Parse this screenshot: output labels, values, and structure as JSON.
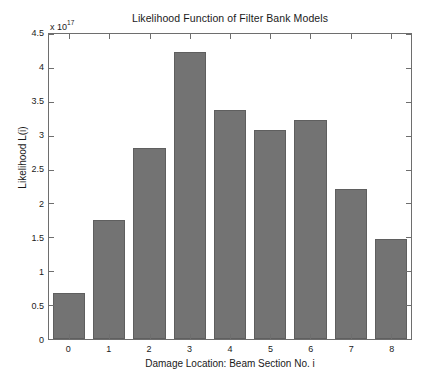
{
  "chart_data": {
    "type": "bar",
    "title": "Likelihood Function of Filter Bank Models",
    "xlabel": "Damage Location: Beam Section No. i",
    "ylabel": "Likelihood L(i)",
    "exponent_prefix": "x 10",
    "exponent_power": "17",
    "categories": [
      "0",
      "1",
      "2",
      "3",
      "4",
      "5",
      "6",
      "7",
      "8"
    ],
    "values": [
      0.68,
      1.75,
      2.82,
      4.24,
      3.38,
      3.08,
      3.23,
      2.21,
      1.47
    ],
    "ytick_labels": [
      "0",
      "0.5",
      "1",
      "1.5",
      "2",
      "2.5",
      "3",
      "3.5",
      "4",
      "4.5"
    ],
    "ytick_values": [
      0,
      0.5,
      1,
      1.5,
      2,
      2.5,
      3,
      3.5,
      4,
      4.5
    ],
    "ylim": [
      0,
      4.5
    ],
    "grid": false,
    "legend": null,
    "bar_color": "#737373",
    "bar_edge_color": "#5f5f5f",
    "axis_color": "#6e6e6e",
    "background_color": "#ffffff"
  }
}
